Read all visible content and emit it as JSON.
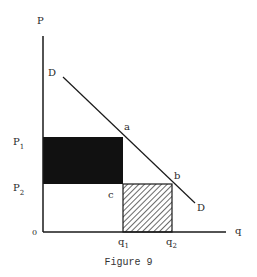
{
  "figure": {
    "caption": "Figure 9",
    "axes": {
      "y_label": "P",
      "x_label": "q",
      "origin_label": "0"
    },
    "price_labels": {
      "p1": {
        "base": "P",
        "sub": "1"
      },
      "p2": {
        "base": "P",
        "sub": "2"
      }
    },
    "quantity_labels": {
      "q1": {
        "base": "q",
        "sub": "1"
      },
      "q2": {
        "base": "q",
        "sub": "2"
      }
    },
    "points": {
      "a": "a",
      "b": "b",
      "c": "c"
    },
    "demand_curve": {
      "start_label": "D",
      "end_label": "D"
    },
    "regions": {
      "solid_rectangle": {
        "fill": "#111111",
        "description": "P1 to P2 by 0 to q1"
      },
      "hatched_rectangle": {
        "fill": "hatch",
        "description": "0 to P2 by q1 to q2"
      }
    },
    "colors": {
      "ink": "#1a1a1a",
      "background": "#ffffff"
    }
  }
}
